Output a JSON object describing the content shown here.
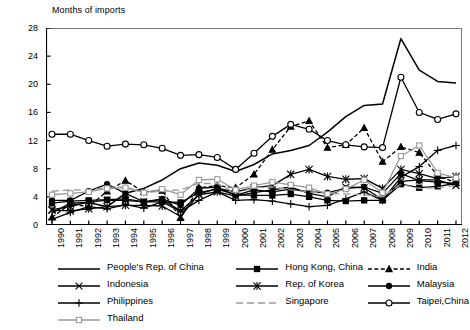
{
  "axis_title": "Months of imports",
  "chart_data": {
    "type": "line",
    "title": "Months of imports",
    "xlabel": "",
    "ylabel": "Months of imports",
    "ylim": [
      0,
      28
    ],
    "yticks": [
      0,
      4,
      8,
      12,
      16,
      20,
      24,
      28
    ],
    "grid": false,
    "legend_position": "bottom",
    "categories": [
      "1990",
      "1991",
      "1992",
      "1993",
      "1994",
      "1995",
      "1996",
      "1997",
      "1998",
      "1999",
      "2000",
      "2001",
      "2002",
      "2003",
      "2004",
      "2005",
      "2006",
      "2007",
      "2008",
      "2009",
      "2010",
      "2011",
      "2012"
    ],
    "series": [
      {
        "name": "People's Rep. of China",
        "marker": "none",
        "dash": "solid",
        "color": "#000000",
        "values": [
          1.7,
          3.1,
          3.2,
          2.6,
          4.5,
          5.2,
          6.4,
          8.0,
          8.8,
          8.5,
          7.6,
          8.6,
          10.1,
          10.6,
          11.3,
          13.2,
          15.4,
          17.0,
          17.2,
          26.5,
          22.0,
          20.4,
          20.2
        ]
      },
      {
        "name": "Hong Kong, China",
        "marker": "square-filled",
        "dash": "solid",
        "color": "#000000",
        "values": [
          3.1,
          3.4,
          3.5,
          3.6,
          3.7,
          3.3,
          3.3,
          3.2,
          4.6,
          5.1,
          4.3,
          4.2,
          4.2,
          4.4,
          4.0,
          3.5,
          3.4,
          3.5,
          3.5,
          5.8,
          5.3,
          5.5,
          5.9
        ]
      },
      {
        "name": "India",
        "marker": "triangle-filled",
        "dash": "dashed",
        "color": "#000000",
        "values": [
          1.1,
          3.0,
          2.6,
          4.8,
          6.3,
          4.7,
          4.9,
          1.0,
          5.3,
          5.6,
          5.3,
          7.2,
          10.7,
          14.0,
          14.8,
          11.0,
          11.4,
          13.8,
          9.0,
          11.1,
          10.3,
          7.0,
          6.0
        ]
      },
      {
        "name": "Indonesia",
        "marker": "x",
        "dash": "solid",
        "color": "#000000",
        "values": [
          2.2,
          2.6,
          3.3,
          3.5,
          3.5,
          3.3,
          3.6,
          2.0,
          4.3,
          4.7,
          4.1,
          4.6,
          5.0,
          5.4,
          4.5,
          4.0,
          5.4,
          5.3,
          3.6,
          6.2,
          6.4,
          6.4,
          5.6
        ]
      },
      {
        "name": "Rep. of Korea",
        "marker": "asterisk",
        "dash": "solid",
        "color": "#000000",
        "values": [
          2.1,
          2.0,
          2.3,
          2.6,
          2.8,
          2.8,
          2.7,
          1.2,
          4.4,
          5.2,
          4.7,
          5.3,
          5.6,
          7.2,
          7.9,
          6.9,
          6.5,
          6.6,
          5.2,
          7.9,
          7.3,
          6.6,
          6.9
        ]
      },
      {
        "name": "Malaysia",
        "marker": "circle-filled",
        "dash": "solid",
        "color": "#000000",
        "values": [
          3.5,
          3.5,
          4.8,
          5.8,
          4.5,
          3.3,
          3.7,
          2.8,
          5.2,
          5.4,
          4.2,
          5.0,
          4.7,
          5.1,
          4.7,
          4.6,
          5.2,
          5.4,
          4.5,
          7.3,
          6.3,
          6.1,
          5.9
        ]
      },
      {
        "name": "Philippines",
        "marker": "plus",
        "dash": "solid",
        "color": "#000000",
        "values": [
          0.8,
          1.8,
          2.6,
          2.3,
          2.9,
          2.4,
          3.3,
          1.9,
          3.5,
          4.7,
          3.5,
          3.6,
          3.4,
          3.0,
          2.6,
          2.8,
          3.7,
          4.7,
          3.5,
          6.8,
          8.3,
          10.6,
          11.3
        ]
      },
      {
        "name": "Singapore",
        "marker": "none",
        "dash": "longdash",
        "color": "#9a9a9a",
        "values": [
          4.8,
          5.0,
          5.0,
          5.3,
          5.4,
          4.6,
          4.8,
          5.0,
          5.9,
          5.9,
          4.5,
          5.3,
          5.4,
          5.0,
          4.7,
          4.5,
          4.4,
          4.3,
          4.0,
          5.8,
          5.2,
          5.3,
          5.6
        ]
      },
      {
        "name": "Taipei,China",
        "marker": "circle-open",
        "dash": "solid",
        "color": "#000000",
        "values": [
          12.9,
          12.9,
          12.0,
          11.2,
          11.5,
          11.4,
          10.9,
          9.9,
          10.0,
          9.6,
          7.9,
          10.2,
          12.6,
          14.3,
          13.6,
          12.0,
          11.4,
          11.1,
          11.0,
          21.0,
          16.0,
          15.0,
          15.8
        ]
      },
      {
        "name": "Thailand",
        "marker": "square-open",
        "dash": "solid",
        "color": "#9a9a9a",
        "values": [
          4.3,
          4.5,
          4.7,
          5.2,
          5.3,
          4.6,
          5.1,
          4.3,
          6.4,
          6.5,
          5.0,
          5.6,
          6.1,
          5.7,
          5.3,
          4.4,
          5.1,
          6.4,
          4.6,
          9.8,
          11.3,
          7.4,
          6.7
        ]
      }
    ]
  },
  "legend": {
    "rows": [
      [
        {
          "name": "People's Rep. of China"
        },
        {
          "name": "Hong Kong, China"
        },
        {
          "name": "India"
        }
      ],
      [
        {
          "name": "Indonesia"
        },
        {
          "name": "Rep. of Korea"
        },
        {
          "name": "Malaysia"
        }
      ],
      [
        {
          "name": "Philippines"
        },
        {
          "name": "Singapore"
        },
        {
          "name": "Taipei,China"
        }
      ],
      [
        {
          "name": "Thailand"
        }
      ]
    ]
  }
}
